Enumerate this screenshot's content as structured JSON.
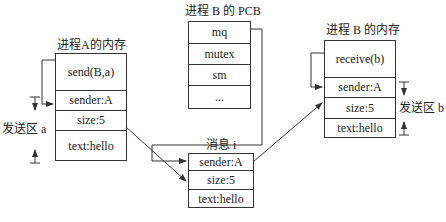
{
  "process_a_memory": {
    "title": "进程A的内存",
    "cells": [
      "send(B,a)",
      "sender:A",
      "size:5",
      "text:hello"
    ],
    "send_area_label": "发送区 a"
  },
  "process_b_pcb": {
    "title": "进程 B 的 PCB",
    "cells": [
      "mq",
      "mutex",
      "sm",
      "..."
    ]
  },
  "process_b_memory": {
    "title": "进程 B 的内存",
    "cells": [
      "receive(b)",
      "sender:A",
      "size:5",
      "text:hello"
    ],
    "send_area_label": "发送区 b"
  },
  "message": {
    "title": "消息 i",
    "cells": [
      "sender:A",
      "size:5",
      "text:hello"
    ]
  }
}
